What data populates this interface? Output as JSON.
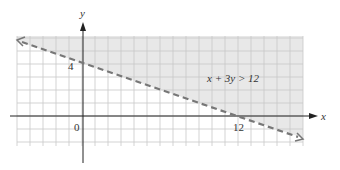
{
  "chart_data": {
    "type": "line",
    "title": "",
    "xlabel": "x",
    "ylabel": "y",
    "xlim": [
      -5,
      17
    ],
    "ylim": [
      -2.3,
      6.1
    ],
    "grid": true,
    "tick_labels": {
      "origin": "0",
      "x": [
        "12"
      ],
      "y": [
        "4"
      ]
    },
    "boundary_line": {
      "equation": "x + 3y = 12",
      "style": "dashed",
      "points": [
        [
          -5,
          5.667
        ],
        [
          17,
          -1.667
        ]
      ],
      "x_intercept": 12,
      "y_intercept": 4
    },
    "shaded_region": {
      "inequality": "x + 3y > 12",
      "side": "above"
    },
    "annotation": "x + 3y > 12",
    "colors": {
      "shade": "#e6e6e6",
      "grid": "#c8c8c8",
      "line": "#777777",
      "axis": "#222222"
    }
  },
  "labels": {
    "x_axis": "x",
    "y_axis": "y",
    "origin": "0",
    "y_tick": "4",
    "x_tick": "12",
    "inequality": "x + 3y > 12"
  }
}
